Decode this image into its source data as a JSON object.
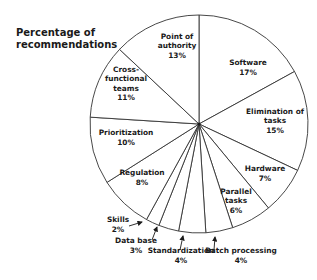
{
  "chart_data": {
    "type": "pie",
    "title": "Percentage of recommendations",
    "start_angle_deg": -90,
    "direction": "clockwise",
    "colors": {
      "fill": "#ffffff",
      "stroke": "#333333",
      "text": "#1a1a1a"
    },
    "slices": [
      {
        "label": "Software",
        "value": 17,
        "display": [
          "Software",
          "17%"
        ],
        "lx": 248,
        "ly": 67
      },
      {
        "label": "Elimination of tasks",
        "value": 15,
        "display": [
          "Elimination of",
          "tasks",
          "15%"
        ],
        "lx": 275,
        "ly": 120
      },
      {
        "label": "Hardware",
        "value": 7,
        "display": [
          "Hardware",
          "7%"
        ],
        "lx": 265,
        "ly": 173
      },
      {
        "label": "Parallel tasks",
        "value": 6,
        "display": [
          "Parallel",
          "tasks",
          "6%"
        ],
        "lx": 236,
        "ly": 200
      },
      {
        "label": "Batch processing",
        "value": 4,
        "display": [
          "Batch processing",
          "4%"
        ],
        "lx": 241,
        "ly": 255,
        "arrow": [
          215,
          237,
          214,
          250
        ]
      },
      {
        "label": "Standardization",
        "value": 4,
        "display": [
          "Standardization",
          "4%"
        ],
        "lx": 181,
        "ly": 255,
        "arrow": [
          183,
          236,
          180,
          250
        ]
      },
      {
        "label": "Data base",
        "value": 3,
        "display": [
          "Data base",
          "3%"
        ],
        "lx": 136,
        "ly": 245,
        "arrow": [
          157,
          227,
          152,
          240
        ]
      },
      {
        "label": "Skills",
        "value": 2,
        "display": [
          "Skills",
          "2%"
        ],
        "lx": 118,
        "ly": 224,
        "arrow": [
          142,
          222,
          129,
          226
        ]
      },
      {
        "label": "Regulation",
        "value": 8,
        "display": [
          "Regulation",
          "8%"
        ],
        "lx": 142,
        "ly": 177
      },
      {
        "label": "Prioritization",
        "value": 10,
        "display": [
          "Prioritization",
          "10%"
        ],
        "lx": 126,
        "ly": 137
      },
      {
        "label": "Cross-functional teams",
        "value": 11,
        "display": [
          "Cross-",
          "functional",
          "teams",
          "11%"
        ],
        "lx": 126,
        "ly": 83
      },
      {
        "label": "Point of authority",
        "value": 13,
        "display": [
          "Point of",
          "authority",
          "13%"
        ],
        "lx": 177,
        "ly": 45
      }
    ],
    "center": [
      199,
      124
    ],
    "radius": 109,
    "legend": "none",
    "grid": false
  }
}
